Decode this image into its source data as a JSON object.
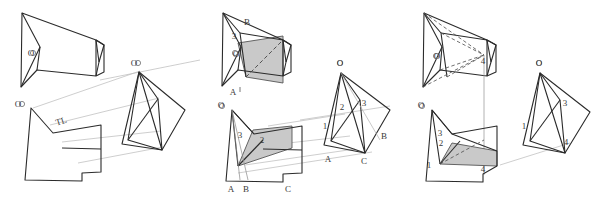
{
  "figure": {
    "background_color": "#ffffff",
    "line_color": "#2b2b2b",
    "thin_line_color": "#b0b0b0",
    "dash_line_color": "#555555",
    "shade_fill": "#c9c9c9",
    "shade_stroke": "#555555",
    "label_color": "#3a3a3a"
  },
  "panels": [
    {
      "id": "panel-1",
      "name": "panel-left",
      "labels": [
        {
          "key": "o_top",
          "text": "O"
        },
        {
          "key": "o_bottom",
          "text": "O"
        },
        {
          "key": "o_right",
          "text": "O"
        },
        {
          "key": "tl",
          "text": "TL"
        }
      ]
    },
    {
      "id": "panel-2",
      "name": "panel-middle",
      "labels": [
        {
          "key": "top_B",
          "text": "B"
        },
        {
          "key": "top_3",
          "text": "3"
        },
        {
          "key": "top_O",
          "text": "O"
        },
        {
          "key": "top_A",
          "text": "A"
        },
        {
          "key": "bl_O",
          "text": "O"
        },
        {
          "key": "bl_3",
          "text": "3"
        },
        {
          "key": "bl_2",
          "text": "2"
        },
        {
          "key": "bl_A",
          "text": "A"
        },
        {
          "key": "bl_B",
          "text": "B"
        },
        {
          "key": "bl_C",
          "text": "C"
        },
        {
          "key": "r_O",
          "text": "O"
        },
        {
          "key": "r_2",
          "text": "2"
        },
        {
          "key": "r_3",
          "text": "3"
        },
        {
          "key": "r_1",
          "text": "1"
        },
        {
          "key": "r_A",
          "text": "A"
        },
        {
          "key": "r_B",
          "text": "B"
        },
        {
          "key": "r_C",
          "text": "C"
        }
      ]
    },
    {
      "id": "panel-3",
      "name": "panel-right",
      "labels": [
        {
          "key": "top_O",
          "text": "O"
        },
        {
          "key": "top_4",
          "text": "4"
        },
        {
          "key": "bl_O",
          "text": "O"
        },
        {
          "key": "bl_3",
          "text": "3"
        },
        {
          "key": "bl_2",
          "text": "2"
        },
        {
          "key": "bl_1",
          "text": "1"
        },
        {
          "key": "bl_4",
          "text": "4"
        },
        {
          "key": "r_O",
          "text": "O"
        },
        {
          "key": "r_3",
          "text": "3"
        },
        {
          "key": "r_1",
          "text": "1"
        },
        {
          "key": "r_4",
          "text": "4"
        }
      ]
    }
  ]
}
